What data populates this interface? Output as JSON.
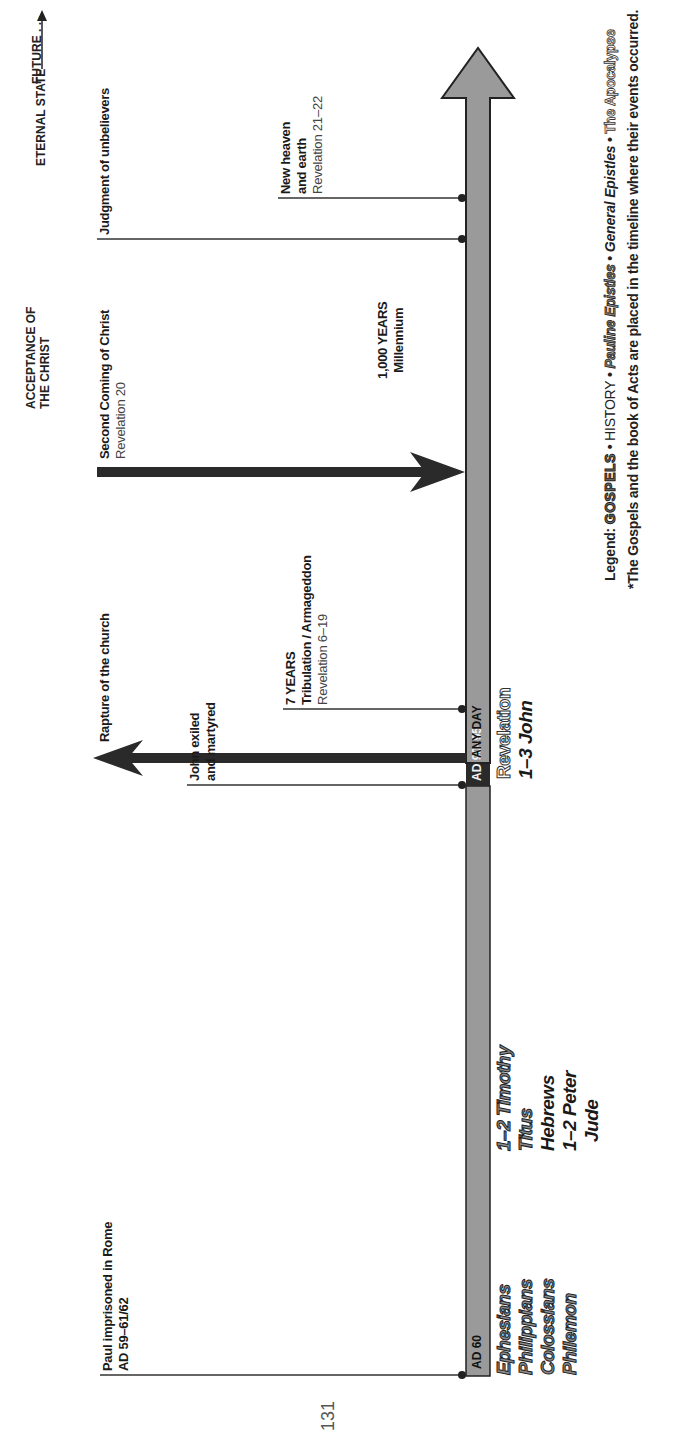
{
  "headers": {
    "future": "FUTURE . . .",
    "acceptance_line1": "ACCEPTANCE OF",
    "acceptance_line2": "THE CHRIST",
    "eternal_state": "ETERNAL STATE"
  },
  "events": {
    "paul": {
      "line1": "Paul imprisoned in Rome",
      "line2": "AD 59–61/62"
    },
    "john": {
      "line1": "John exiled",
      "line2": "and martyred"
    },
    "rapture": {
      "line1": "Rapture of the church"
    },
    "tribulation": {
      "line1": "7 YEARS",
      "line2": "Tribulation / Armageddon",
      "line3": "Revelation 6–19"
    },
    "second_coming": {
      "line1": "Second Coming of Christ",
      "line2": "Revelation 20"
    },
    "millennium": {
      "line1": "1,000 YEARS",
      "line2": "Millennium"
    },
    "judgment": {
      "line1": "Judgment of unbelievers"
    },
    "new_heaven": {
      "line1": "New heaven",
      "line2": "and earth",
      "line3": "Revelation 21–22"
    }
  },
  "timeline_bar": {
    "segment_1_label": "AD 60",
    "segment_2_label": "AD 90–95",
    "segment_3_label": "ANY DAY",
    "bar_color": "#9a9a9a",
    "dark_color": "#2a2a2a"
  },
  "books": {
    "ad60_pauline": [
      "Ephesians",
      "Philippians",
      "Colossians",
      "Philemon"
    ],
    "ad60_mixed": [
      {
        "name": "1–2 Timothy",
        "type": "pauline"
      },
      {
        "name": "Titus",
        "type": "pauline"
      },
      {
        "name": "Hebrews",
        "type": "general"
      },
      {
        "name": "1–2 Peter",
        "type": "general"
      },
      {
        "name": "Jude",
        "type": "general"
      }
    ],
    "ad90": [
      {
        "name": "Revelation",
        "type": "apocalypse"
      },
      {
        "name": "1–3 John",
        "type": "general"
      }
    ]
  },
  "legend": {
    "prefix": "Legend:",
    "gospels": "GOSPELS",
    "history": "HISTORY",
    "pauline": "Pauline Epistles",
    "general": "General Epistles",
    "apocalypse": "The Apocalypse",
    "separator": "•",
    "footnote": "*The Gospels and the book of Acts are placed in the timeline where their events occurred."
  },
  "page_number": "131"
}
